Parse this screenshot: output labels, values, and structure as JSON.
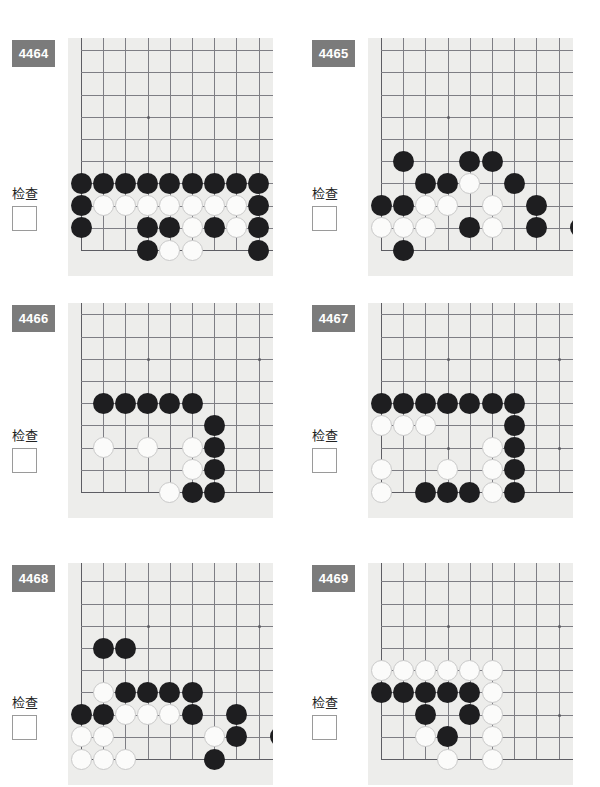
{
  "page": {
    "background": "#ffffff",
    "width": 600,
    "height": 787,
    "badge_color": "#7b7b7b",
    "board_color": "#ededeb",
    "line_color": "#7e7e84",
    "black_stone_color": "#1e1e20",
    "white_stone_color": "#fbfbfa"
  },
  "common": {
    "check_label": "检查",
    "checkbox_value": ""
  },
  "problems": [
    {
      "id": "4464",
      "label": "4464",
      "check_label": "检查",
      "board": {
        "cols": 10,
        "rows": 10,
        "left_edge": true,
        "bottom_edge": true,
        "star_points": [
          [
            3,
            3
          ]
        ],
        "stones": [
          {
            "c": 0,
            "r": 6,
            "color": "black"
          },
          {
            "c": 1,
            "r": 6,
            "color": "black"
          },
          {
            "c": 2,
            "r": 6,
            "color": "black"
          },
          {
            "c": 3,
            "r": 6,
            "color": "black"
          },
          {
            "c": 4,
            "r": 6,
            "color": "black"
          },
          {
            "c": 5,
            "r": 6,
            "color": "black"
          },
          {
            "c": 6,
            "r": 6,
            "color": "black"
          },
          {
            "c": 7,
            "r": 6,
            "color": "black"
          },
          {
            "c": 8,
            "r": 6,
            "color": "black"
          },
          {
            "c": 0,
            "r": 7,
            "color": "black"
          },
          {
            "c": 1,
            "r": 7,
            "color": "white"
          },
          {
            "c": 2,
            "r": 7,
            "color": "white"
          },
          {
            "c": 3,
            "r": 7,
            "color": "white"
          },
          {
            "c": 4,
            "r": 7,
            "color": "white"
          },
          {
            "c": 5,
            "r": 7,
            "color": "white"
          },
          {
            "c": 6,
            "r": 7,
            "color": "white"
          },
          {
            "c": 7,
            "r": 7,
            "color": "white"
          },
          {
            "c": 8,
            "r": 7,
            "color": "black"
          },
          {
            "c": 0,
            "r": 8,
            "color": "black"
          },
          {
            "c": 3,
            "r": 8,
            "color": "black"
          },
          {
            "c": 4,
            "r": 8,
            "color": "black"
          },
          {
            "c": 5,
            "r": 8,
            "color": "white"
          },
          {
            "c": 6,
            "r": 8,
            "color": "black"
          },
          {
            "c": 7,
            "r": 8,
            "color": "white"
          },
          {
            "c": 8,
            "r": 8,
            "color": "black"
          },
          {
            "c": 3,
            "r": 9,
            "color": "black"
          },
          {
            "c": 4,
            "r": 9,
            "color": "white"
          },
          {
            "c": 5,
            "r": 9,
            "color": "white"
          },
          {
            "c": 8,
            "r": 9,
            "color": "black"
          }
        ]
      }
    },
    {
      "id": "4465",
      "label": "4465",
      "check_label": "检查",
      "board": {
        "cols": 10,
        "rows": 10,
        "left_edge": true,
        "bottom_edge": true,
        "star_points": [
          [
            3,
            3
          ]
        ],
        "stones": [
          {
            "c": 1,
            "r": 5,
            "color": "black"
          },
          {
            "c": 4,
            "r": 5,
            "color": "black"
          },
          {
            "c": 5,
            "r": 5,
            "color": "black"
          },
          {
            "c": 2,
            "r": 6,
            "color": "black"
          },
          {
            "c": 3,
            "r": 6,
            "color": "black"
          },
          {
            "c": 4,
            "r": 6,
            "color": "white"
          },
          {
            "c": 6,
            "r": 6,
            "color": "black"
          },
          {
            "c": 0,
            "r": 7,
            "color": "black"
          },
          {
            "c": 1,
            "r": 7,
            "color": "black"
          },
          {
            "c": 2,
            "r": 7,
            "color": "white"
          },
          {
            "c": 3,
            "r": 7,
            "color": "white"
          },
          {
            "c": 5,
            "r": 7,
            "color": "white"
          },
          {
            "c": 7,
            "r": 7,
            "color": "black"
          },
          {
            "c": 0,
            "r": 8,
            "color": "white"
          },
          {
            "c": 1,
            "r": 8,
            "color": "white"
          },
          {
            "c": 2,
            "r": 8,
            "color": "white"
          },
          {
            "c": 4,
            "r": 8,
            "color": "black"
          },
          {
            "c": 5,
            "r": 8,
            "color": "white"
          },
          {
            "c": 7,
            "r": 8,
            "color": "black"
          },
          {
            "c": 9,
            "r": 8,
            "color": "black"
          },
          {
            "c": 1,
            "r": 9,
            "color": "black"
          }
        ]
      }
    },
    {
      "id": "4466",
      "label": "4466",
      "check_label": "检查",
      "board": {
        "cols": 10,
        "rows": 10,
        "left_edge": true,
        "bottom_edge": true,
        "star_points": [
          [
            3,
            3
          ],
          [
            3,
            7
          ],
          [
            8,
            3
          ]
        ],
        "stones": [
          {
            "c": 1,
            "r": 5,
            "color": "black"
          },
          {
            "c": 2,
            "r": 5,
            "color": "black"
          },
          {
            "c": 3,
            "r": 5,
            "color": "black"
          },
          {
            "c": 4,
            "r": 5,
            "color": "black"
          },
          {
            "c": 5,
            "r": 5,
            "color": "black"
          },
          {
            "c": 6,
            "r": 6,
            "color": "black"
          },
          {
            "c": 1,
            "r": 7,
            "color": "white"
          },
          {
            "c": 3,
            "r": 7,
            "color": "white"
          },
          {
            "c": 5,
            "r": 7,
            "color": "white"
          },
          {
            "c": 6,
            "r": 7,
            "color": "black"
          },
          {
            "c": 5,
            "r": 8,
            "color": "white"
          },
          {
            "c": 6,
            "r": 8,
            "color": "black"
          },
          {
            "c": 4,
            "r": 9,
            "color": "white"
          },
          {
            "c": 5,
            "r": 9,
            "color": "black"
          },
          {
            "c": 6,
            "r": 9,
            "color": "black"
          }
        ]
      }
    },
    {
      "id": "4467",
      "label": "4467",
      "check_label": "检查",
      "board": {
        "cols": 10,
        "rows": 10,
        "left_edge": true,
        "bottom_edge": true,
        "star_points": [
          [
            3,
            3
          ],
          [
            3,
            7
          ],
          [
            8,
            3
          ],
          [
            8,
            7
          ]
        ],
        "stones": [
          {
            "c": 0,
            "r": 5,
            "color": "black"
          },
          {
            "c": 1,
            "r": 5,
            "color": "black"
          },
          {
            "c": 2,
            "r": 5,
            "color": "black"
          },
          {
            "c": 3,
            "r": 5,
            "color": "black"
          },
          {
            "c": 4,
            "r": 5,
            "color": "black"
          },
          {
            "c": 5,
            "r": 5,
            "color": "black"
          },
          {
            "c": 6,
            "r": 5,
            "color": "black"
          },
          {
            "c": 0,
            "r": 6,
            "color": "white"
          },
          {
            "c": 1,
            "r": 6,
            "color": "white"
          },
          {
            "c": 2,
            "r": 6,
            "color": "white"
          },
          {
            "c": 6,
            "r": 6,
            "color": "black"
          },
          {
            "c": 5,
            "r": 7,
            "color": "white"
          },
          {
            "c": 6,
            "r": 7,
            "color": "black"
          },
          {
            "c": 0,
            "r": 8,
            "color": "white"
          },
          {
            "c": 3,
            "r": 8,
            "color": "white"
          },
          {
            "c": 5,
            "r": 8,
            "color": "white"
          },
          {
            "c": 6,
            "r": 8,
            "color": "black"
          },
          {
            "c": 0,
            "r": 9,
            "color": "white"
          },
          {
            "c": 2,
            "r": 9,
            "color": "black"
          },
          {
            "c": 3,
            "r": 9,
            "color": "black"
          },
          {
            "c": 4,
            "r": 9,
            "color": "black"
          },
          {
            "c": 5,
            "r": 9,
            "color": "white"
          },
          {
            "c": 6,
            "r": 9,
            "color": "black"
          }
        ]
      }
    },
    {
      "id": "4468",
      "label": "4468",
      "check_label": "检查",
      "board": {
        "cols": 10,
        "rows": 10,
        "left_edge": true,
        "bottom_edge": true,
        "star_points": [
          [
            3,
            3
          ],
          [
            8,
            3
          ]
        ],
        "stones": [
          {
            "c": 1,
            "r": 4,
            "color": "black"
          },
          {
            "c": 2,
            "r": 4,
            "color": "black"
          },
          {
            "c": 1,
            "r": 6,
            "color": "white"
          },
          {
            "c": 2,
            "r": 6,
            "color": "black"
          },
          {
            "c": 3,
            "r": 6,
            "color": "black"
          },
          {
            "c": 4,
            "r": 6,
            "color": "black"
          },
          {
            "c": 5,
            "r": 6,
            "color": "black"
          },
          {
            "c": 0,
            "r": 7,
            "color": "black"
          },
          {
            "c": 1,
            "r": 7,
            "color": "black"
          },
          {
            "c": 2,
            "r": 7,
            "color": "white"
          },
          {
            "c": 3,
            "r": 7,
            "color": "white"
          },
          {
            "c": 4,
            "r": 7,
            "color": "white"
          },
          {
            "c": 5,
            "r": 7,
            "color": "black"
          },
          {
            "c": 7,
            "r": 7,
            "color": "black"
          },
          {
            "c": 0,
            "r": 8,
            "color": "white"
          },
          {
            "c": 1,
            "r": 8,
            "color": "white"
          },
          {
            "c": 6,
            "r": 8,
            "color": "white"
          },
          {
            "c": 7,
            "r": 8,
            "color": "black"
          },
          {
            "c": 9,
            "r": 8,
            "color": "black"
          },
          {
            "c": 0,
            "r": 9,
            "color": "white"
          },
          {
            "c": 1,
            "r": 9,
            "color": "white"
          },
          {
            "c": 2,
            "r": 9,
            "color": "white"
          },
          {
            "c": 6,
            "r": 9,
            "color": "black"
          }
        ]
      }
    },
    {
      "id": "4469",
      "label": "4469",
      "check_label": "检查",
      "board": {
        "cols": 10,
        "rows": 10,
        "left_edge": true,
        "bottom_edge": true,
        "star_points": [
          [
            3,
            3
          ],
          [
            8,
            3
          ],
          [
            8,
            7
          ]
        ],
        "stones": [
          {
            "c": 0,
            "r": 5,
            "color": "white"
          },
          {
            "c": 1,
            "r": 5,
            "color": "white"
          },
          {
            "c": 2,
            "r": 5,
            "color": "white"
          },
          {
            "c": 3,
            "r": 5,
            "color": "white"
          },
          {
            "c": 4,
            "r": 5,
            "color": "white"
          },
          {
            "c": 5,
            "r": 5,
            "color": "white"
          },
          {
            "c": 0,
            "r": 6,
            "color": "black"
          },
          {
            "c": 1,
            "r": 6,
            "color": "black"
          },
          {
            "c": 2,
            "r": 6,
            "color": "black"
          },
          {
            "c": 3,
            "r": 6,
            "color": "black"
          },
          {
            "c": 4,
            "r": 6,
            "color": "black"
          },
          {
            "c": 5,
            "r": 6,
            "color": "white"
          },
          {
            "c": 2,
            "r": 7,
            "color": "black"
          },
          {
            "c": 4,
            "r": 7,
            "color": "black"
          },
          {
            "c": 5,
            "r": 7,
            "color": "white"
          },
          {
            "c": 2,
            "r": 8,
            "color": "white"
          },
          {
            "c": 3,
            "r": 8,
            "color": "black"
          },
          {
            "c": 5,
            "r": 8,
            "color": "white"
          },
          {
            "c": 3,
            "r": 9,
            "color": "white"
          },
          {
            "c": 5,
            "r": 9,
            "color": "white"
          }
        ]
      }
    }
  ]
}
